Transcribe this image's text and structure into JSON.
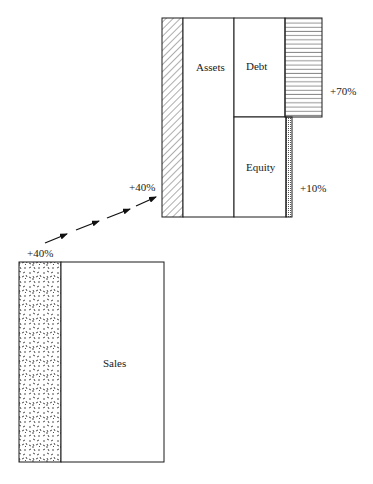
{
  "diagram": {
    "type": "balance-sheet-growth-illustration",
    "sales_block": {
      "label": "Sales",
      "growth_label": "+40%",
      "growth_fill": "speckled"
    },
    "balance_sheet_block": {
      "assets": {
        "label": "Assets",
        "growth_label": "+40%",
        "growth_fill": "diagonal-hatch"
      },
      "debt": {
        "label": "Debt",
        "growth_label": "+70%",
        "growth_fill": "horizontal-hatch"
      },
      "equity": {
        "label": "Equity",
        "growth_label": "+10%",
        "growth_fill": "dotted"
      }
    },
    "connector": {
      "style": "dashed-arrows",
      "direction": "sales-to-assets"
    },
    "colors": {
      "line": "#1a1a1a",
      "background": "#ffffff"
    }
  }
}
